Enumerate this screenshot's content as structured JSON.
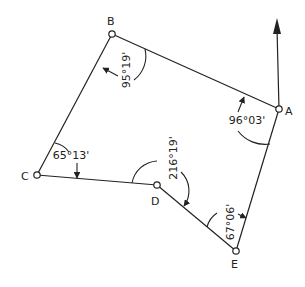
{
  "diagram": {
    "type": "traverse",
    "stroke_color": "#222222",
    "background": "#ffffff",
    "north_arrow": {
      "from_point": "A",
      "tip": [
        277,
        20
      ]
    },
    "points": [
      {
        "id": "A",
        "label": "A",
        "x": 279,
        "y": 109,
        "label_x": 285,
        "label_y": 115
      },
      {
        "id": "B",
        "label": "B",
        "x": 112,
        "y": 34,
        "label_x": 107,
        "label_y": 25
      },
      {
        "id": "C",
        "label": "C",
        "x": 37,
        "y": 175,
        "label_x": 21,
        "label_y": 180
      },
      {
        "id": "D",
        "label": "D",
        "x": 157,
        "y": 185,
        "label_x": 151,
        "label_y": 205
      },
      {
        "id": "E",
        "label": "E",
        "x": 236,
        "y": 251,
        "label_x": 231,
        "label_y": 268
      }
    ],
    "edges": [
      [
        "A",
        "B"
      ],
      [
        "B",
        "C"
      ],
      [
        "C",
        "D"
      ],
      [
        "D",
        "E"
      ],
      [
        "E",
        "A"
      ]
    ],
    "angles": [
      {
        "at": "B",
        "text": "95°19'",
        "x": 128,
        "y": 70,
        "rotate": -90
      },
      {
        "at": "A",
        "text": "96°03'",
        "x": 246,
        "y": 125,
        "rotate": 0
      },
      {
        "at": "C",
        "text": "65°13'",
        "x": 70,
        "y": 160,
        "rotate": 0
      },
      {
        "at": "D",
        "text": "216°19'",
        "x": 175,
        "y": 158,
        "rotate": -90
      },
      {
        "at": "E",
        "text": "67°06'",
        "x": 232,
        "y": 222,
        "rotate": -90
      }
    ]
  }
}
